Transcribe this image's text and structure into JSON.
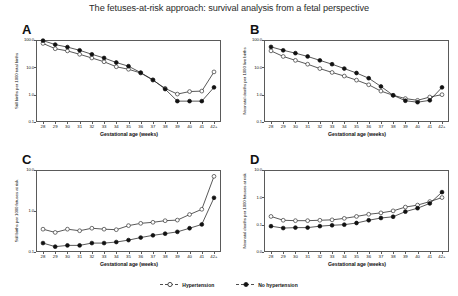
{
  "figure": {
    "title": "The fetuses-at-risk approach: survival analysis from a fetal perspective"
  },
  "legend": {
    "position": "bottom-center",
    "entries": [
      {
        "label": "Hypertension",
        "marker": "open-circle",
        "color": "#111111"
      },
      {
        "label": "No hypertension",
        "marker": "filled-circle",
        "color": "#111111"
      }
    ]
  },
  "panels": [
    {
      "letter": "A"
    },
    {
      "letter": "B"
    },
    {
      "letter": "C"
    },
    {
      "letter": "D"
    }
  ],
  "chart_data": [
    {
      "type": "line",
      "panel": "A",
      "title": "",
      "xlabel": "Gestational age (weeks)",
      "ylabel": "Still births per 1000 total births",
      "categories": [
        "28",
        "29",
        "30",
        "31",
        "32",
        "33",
        "34",
        "35",
        "36",
        "37",
        "38",
        "39",
        "40",
        "41",
        "42+"
      ],
      "yscale": "log",
      "ylim": [
        0.1,
        100.0
      ],
      "yticks": [
        0.1,
        1.0,
        10.0,
        100.0
      ],
      "yticklabels": [
        "0.1",
        "1.0",
        "10.0",
        "100.0"
      ],
      "grid": false,
      "series": [
        {
          "name": "Hypertension",
          "marker": "open-circle",
          "values": [
            75.0,
            48.0,
            40.0,
            30.0,
            22.0,
            16.0,
            10.5,
            8.5,
            6.2,
            3.4,
            1.7,
            1.05,
            1.3,
            1.35,
            6.8
          ]
        },
        {
          "name": "No hypertension",
          "marker": "filled-circle",
          "values": [
            95.0,
            68.0,
            55.0,
            42.0,
            30.0,
            22.0,
            15.0,
            11.0,
            6.4,
            3.5,
            1.6,
            0.58,
            0.58,
            0.58,
            1.85
          ]
        }
      ]
    },
    {
      "type": "line",
      "panel": "B",
      "title": "",
      "xlabel": "Gestational age (weeks)",
      "ylabel": "Neonatal deaths per 1000 live births",
      "categories": [
        "28",
        "29",
        "30",
        "31",
        "32",
        "33",
        "34",
        "35",
        "36",
        "37",
        "38",
        "39",
        "40",
        "41",
        "42+"
      ],
      "yscale": "log",
      "ylim": [
        0.1,
        100.0
      ],
      "yticks": [
        0.1,
        1.0,
        10.0,
        100.0
      ],
      "yticklabels": [
        "0.1",
        "1.0",
        "10.0",
        "100.0"
      ],
      "grid": false,
      "series": [
        {
          "name": "Hypertension",
          "marker": "open-circle",
          "values": [
            40.0,
            25.0,
            18.0,
            13.0,
            9.0,
            6.5,
            4.8,
            3.4,
            2.3,
            1.35,
            0.95,
            0.72,
            0.62,
            0.82,
            1.0
          ]
        },
        {
          "name": "No hypertension",
          "marker": "filled-circle",
          "values": [
            56.0,
            42.0,
            33.0,
            25.0,
            18.0,
            13.0,
            9.0,
            6.2,
            4.0,
            2.0,
            0.95,
            0.6,
            0.53,
            0.62,
            1.85
          ]
        }
      ]
    },
    {
      "type": "line",
      "panel": "C",
      "title": "",
      "xlabel": "Gestational age (weeks)",
      "ylabel": "Still births per 1000 fetuses at risk",
      "categories": [
        "28",
        "29",
        "30",
        "31",
        "32",
        "33",
        "34",
        "35",
        "36",
        "37",
        "38",
        "39",
        "40",
        "41",
        "42+"
      ],
      "yscale": "log",
      "ylim": [
        0.1,
        10.0
      ],
      "yticks": [
        0.1,
        1.0,
        10.0
      ],
      "yticklabels": [
        "0.1",
        "1.0",
        "10.0"
      ],
      "grid": false,
      "series": [
        {
          "name": "Hypertension",
          "marker": "open-circle",
          "values": [
            0.36,
            0.3,
            0.36,
            0.33,
            0.38,
            0.36,
            0.35,
            0.44,
            0.5,
            0.53,
            0.58,
            0.6,
            0.82,
            1.1,
            7.0
          ]
        },
        {
          "name": "No hypertension",
          "marker": "filled-circle",
          "values": [
            0.165,
            0.135,
            0.145,
            0.145,
            0.165,
            0.165,
            0.175,
            0.195,
            0.225,
            0.255,
            0.28,
            0.31,
            0.38,
            0.47,
            2.1
          ]
        }
      ]
    },
    {
      "type": "line",
      "panel": "D",
      "title": "",
      "xlabel": "Gestational age (weeks)",
      "ylabel": "Neonatal deaths per 1000 fetuses at risk",
      "categories": [
        "28",
        "29",
        "30",
        "31",
        "32",
        "33",
        "34",
        "35",
        "36",
        "37",
        "38",
        "39",
        "40",
        "41",
        "42+"
      ],
      "yscale": "log",
      "ylim": [
        0.01,
        10.0
      ],
      "yticks": [
        0.01,
        0.1,
        1.0,
        10.0
      ],
      "yticklabels": [
        "0.0",
        "0.1",
        "1.0",
        "10.0"
      ],
      "grid": false,
      "series": [
        {
          "name": "Hypertension",
          "marker": "open-circle",
          "values": [
            0.2,
            0.145,
            0.14,
            0.14,
            0.145,
            0.15,
            0.17,
            0.2,
            0.24,
            0.27,
            0.32,
            0.44,
            0.52,
            0.7,
            0.98
          ]
        },
        {
          "name": "No hypertension",
          "marker": "filled-circle",
          "values": [
            0.088,
            0.075,
            0.078,
            0.078,
            0.088,
            0.095,
            0.1,
            0.115,
            0.145,
            0.175,
            0.195,
            0.3,
            0.4,
            0.6,
            1.55
          ]
        }
      ]
    }
  ]
}
